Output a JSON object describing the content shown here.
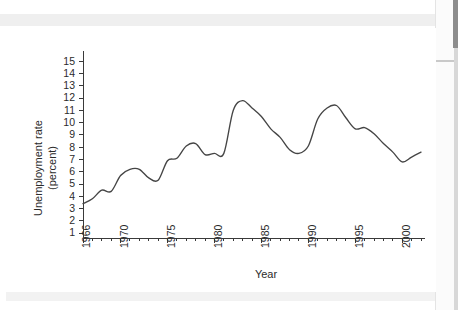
{
  "figure": {
    "ylabel_line1": "Unemployment rate",
    "ylabel_line2": "(percent)",
    "xlabel": "Year"
  },
  "chart_data": {
    "type": "line",
    "title": "",
    "xlabel": "Year",
    "ylabel": "Unemployment rate (percent)",
    "xlim": [
      1966,
      2002
    ],
    "ylim": [
      0.6,
      15.6
    ],
    "grid": false,
    "legend": null,
    "y_ticks": [
      1,
      2,
      3,
      4,
      5,
      6,
      7,
      8,
      9,
      10,
      11,
      12,
      13,
      14,
      15
    ],
    "y_tick_labels": [
      "1",
      "2",
      "3",
      "4",
      "5",
      "6",
      "7",
      "8",
      "9",
      "10",
      "11",
      "12",
      "13",
      "14",
      "15"
    ],
    "x_ticks": [
      1966,
      1970,
      1975,
      1980,
      1985,
      1990,
      1995,
      2000
    ],
    "x_tick_labels": [
      "1966",
      "1970",
      "1975",
      "1980",
      "1985",
      "1990",
      "1995",
      "2000"
    ],
    "x_minor_tick_step": 1,
    "series": [
      {
        "name": "Unemployment rate",
        "color": "#454545",
        "x": [
          1966,
          1967,
          1968,
          1969,
          1970,
          1971,
          1972,
          1973,
          1974,
          1975,
          1976,
          1977,
          1978,
          1979,
          1980,
          1981,
          1982,
          1983,
          1984,
          1985,
          1986,
          1987,
          1988,
          1989,
          1990,
          1991,
          1992,
          1993,
          1994,
          1995,
          1996,
          1997,
          1998,
          1999,
          2000,
          2001,
          2002
        ],
        "values": [
          3.4,
          3.8,
          4.5,
          4.4,
          5.7,
          6.2,
          6.2,
          5.5,
          5.3,
          6.9,
          7.1,
          8.1,
          8.3,
          7.4,
          7.5,
          7.5,
          11.0,
          11.8,
          11.2,
          10.5,
          9.5,
          8.8,
          7.8,
          7.5,
          8.1,
          10.3,
          11.2,
          11.4,
          10.4,
          9.5,
          9.6,
          9.1,
          8.3,
          7.6,
          6.8,
          7.2,
          7.6
        ],
        "marker": "none",
        "linewidth": 1.35
      }
    ]
  }
}
